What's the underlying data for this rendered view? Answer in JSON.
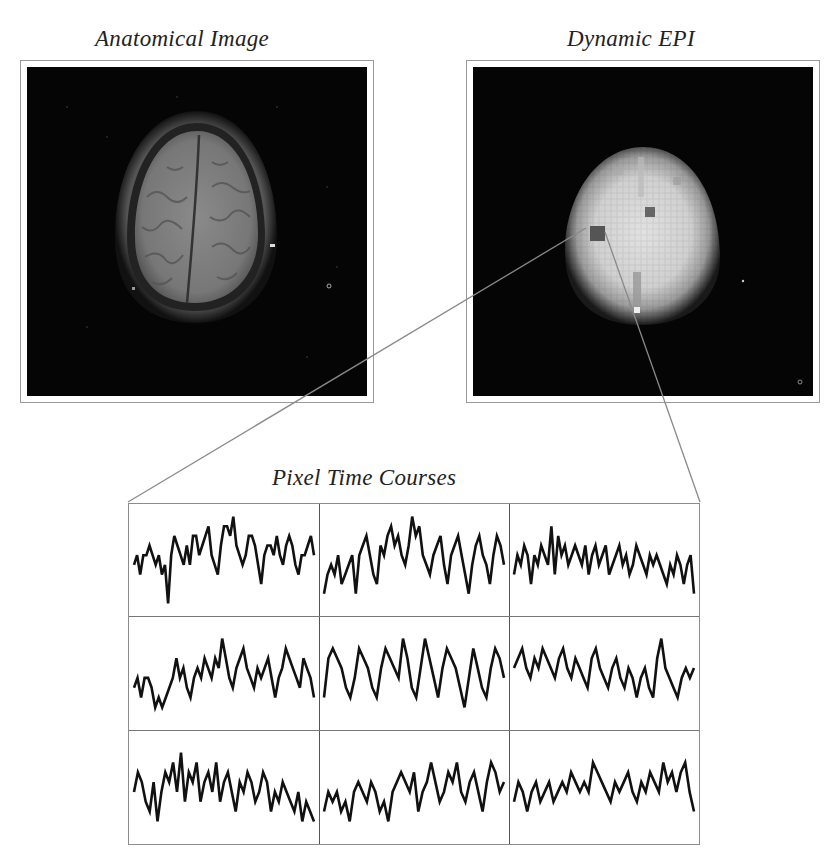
{
  "figure": {
    "panels": [
      {
        "id": "anatomical",
        "title": "Anatomical Image"
      },
      {
        "id": "epi",
        "title": "Dynamic EPI"
      }
    ],
    "timecourses_title": "Pixel Time Courses",
    "colors": {
      "background": "#ffffff",
      "image_background": "#050505",
      "connector_line": "#8a8a8a",
      "trace": "#111111",
      "frame_border": "#9a9a9a"
    }
  },
  "chart_data": {
    "type": "line",
    "title": "Pixel Time Courses",
    "layout": {
      "rows": 3,
      "cols": 3
    },
    "xlabel": "",
    "ylabel": "",
    "axes_visible": false,
    "grid": false,
    "series": [
      {
        "name": "r1c1",
        "values": [
          5,
          6,
          4,
          6,
          6,
          7,
          6,
          5,
          6,
          4,
          5,
          1,
          6,
          8,
          7,
          6,
          5,
          7,
          5,
          8,
          8,
          6,
          7,
          8,
          9,
          6,
          5,
          4,
          7,
          9,
          9,
          8,
          10,
          7,
          6,
          5,
          6,
          8,
          8,
          7,
          5,
          3,
          6,
          7,
          7,
          6,
          8,
          6,
          5,
          7,
          8,
          7,
          5,
          4,
          6,
          6,
          7,
          8,
          6
        ]
      },
      {
        "name": "r1c2",
        "values": [
          2,
          4,
          5,
          4,
          6,
          3,
          4,
          5,
          6,
          2,
          6,
          7,
          8,
          6,
          4,
          3,
          7,
          6,
          8,
          9,
          7,
          8,
          6,
          5,
          7,
          10,
          8,
          9,
          6,
          5,
          4,
          6,
          7,
          8,
          5,
          3,
          6,
          7,
          8,
          6,
          4,
          2,
          5,
          7,
          8,
          6,
          5,
          3,
          6,
          8,
          7,
          5
        ]
      },
      {
        "name": "r1c3",
        "values": [
          4,
          6,
          5,
          7,
          6,
          3,
          6,
          5,
          7,
          6,
          5,
          9,
          4,
          8,
          6,
          7,
          5,
          6,
          7,
          6,
          5,
          7,
          4,
          6,
          7,
          5,
          6,
          7,
          4,
          5,
          6,
          7,
          5,
          6,
          4,
          5,
          7,
          6,
          5,
          4,
          6,
          5,
          6,
          5,
          4,
          3,
          5,
          4,
          6,
          5,
          3,
          5,
          6,
          2
        ]
      },
      {
        "name": "r2c1",
        "values": [
          4,
          5,
          3,
          5,
          5,
          4,
          2,
          3,
          2,
          3,
          4,
          5,
          7,
          5,
          6,
          4,
          3,
          5,
          6,
          5,
          7,
          6,
          5,
          7,
          6,
          9,
          7,
          5,
          4,
          6,
          7,
          8,
          6,
          5,
          4,
          6,
          5,
          6,
          7,
          5,
          3,
          5,
          6,
          8,
          7,
          6,
          5,
          4,
          7,
          6,
          5,
          3
        ]
      },
      {
        "name": "r2c2",
        "values": [
          3,
          7,
          8,
          7,
          6,
          4,
          3,
          5,
          8,
          7,
          6,
          4,
          3,
          6,
          8,
          7,
          6,
          5,
          9,
          7,
          4,
          3,
          6,
          9,
          7,
          5,
          3,
          6,
          8,
          7,
          6,
          4,
          2,
          5,
          8,
          6,
          4,
          3,
          6,
          8,
          7,
          5
        ]
      },
      {
        "name": "r2c3",
        "values": [
          6,
          7,
          8,
          6,
          5,
          7,
          6,
          8,
          7,
          6,
          5,
          7,
          8,
          6,
          5,
          7,
          6,
          5,
          4,
          7,
          8,
          6,
          5,
          4,
          6,
          7,
          5,
          4,
          6,
          5,
          3,
          5,
          6,
          4,
          3,
          7,
          9,
          6,
          5,
          4,
          3,
          5,
          6,
          5,
          6
        ]
      },
      {
        "name": "r3c1",
        "values": [
          5,
          7,
          6,
          4,
          3,
          6,
          2,
          5,
          7,
          6,
          8,
          5,
          9,
          4,
          7,
          6,
          8,
          4,
          6,
          7,
          5,
          8,
          4,
          6,
          7,
          5,
          3,
          6,
          5,
          7,
          6,
          4,
          5,
          7,
          6,
          3,
          5,
          4,
          6,
          5,
          4,
          3,
          5,
          2,
          4,
          3,
          2
        ]
      },
      {
        "name": "r3c2",
        "values": [
          3,
          5,
          4,
          5,
          3,
          4,
          2,
          5,
          6,
          5,
          4,
          6,
          5,
          3,
          4,
          2,
          5,
          6,
          7,
          6,
          5,
          7,
          3,
          5,
          6,
          8,
          6,
          4,
          5,
          7,
          6,
          8,
          5,
          4,
          6,
          7,
          5,
          3,
          6,
          8,
          7,
          5,
          6
        ]
      },
      {
        "name": "r3c3",
        "values": [
          4,
          6,
          5,
          3,
          5,
          6,
          4,
          5,
          6,
          4,
          5,
          6,
          5,
          7,
          6,
          5,
          6,
          5,
          8,
          7,
          6,
          5,
          4,
          6,
          5,
          6,
          7,
          5,
          4,
          6,
          5,
          7,
          6,
          5,
          8,
          6,
          7,
          5,
          7,
          8,
          5,
          3
        ]
      }
    ]
  }
}
